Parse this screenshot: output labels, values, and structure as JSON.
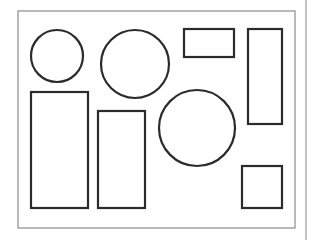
{
  "diagram": {
    "colors": {
      "background": "#ffffff",
      "frame_stroke": "#8a8a8a",
      "shape_stroke": "#2b2b2b",
      "divider_stroke": "#9a9a9a"
    },
    "frame": {
      "x": 18,
      "y": 11,
      "width": 277,
      "height": 217
    },
    "divider": {
      "x": 306,
      "y1": 0,
      "y2": 240
    },
    "shapes": [
      {
        "id": "circle-small-top-left",
        "type": "circle",
        "cx": 57,
        "cy": 56,
        "r": 26
      },
      {
        "id": "circle-medium-top",
        "type": "circle",
        "cx": 135,
        "cy": 64,
        "r": 34
      },
      {
        "id": "rect-small-top",
        "type": "rect",
        "x": 184,
        "y": 29,
        "width": 50,
        "height": 28
      },
      {
        "id": "rect-tall-right",
        "type": "rect",
        "x": 248,
        "y": 29,
        "width": 34,
        "height": 95
      },
      {
        "id": "rect-tall-left",
        "type": "rect",
        "x": 31,
        "y": 92,
        "width": 57,
        "height": 116
      },
      {
        "id": "rect-mid-bottom",
        "type": "rect",
        "x": 98,
        "y": 111,
        "width": 47,
        "height": 97
      },
      {
        "id": "circle-large-center",
        "type": "circle",
        "cx": 197,
        "cy": 128,
        "r": 38
      },
      {
        "id": "square-bottom-right",
        "type": "rect",
        "x": 242,
        "y": 166,
        "width": 40,
        "height": 42
      }
    ]
  }
}
